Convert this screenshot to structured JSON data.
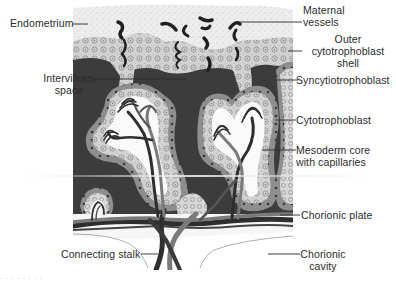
{
  "diagram": {
    "colors": {
      "background": "#ffffff",
      "endometrium": "#e9e9e9",
      "cytotrophoblast_shell": "#cfcfcf",
      "syncytiotrophoblast": "#8a8a8a",
      "intervillous_space": "#3a3a3a",
      "mesoderm_core": "#fafafa",
      "vessel_dark": "#2e2e2e",
      "vessel_light": "#7a7a7a",
      "label_text": "#2b2b2b"
    },
    "labels": {
      "endometrium": "Endometrium",
      "maternal_vessels": [
        "Maternal",
        "vessels"
      ],
      "outer_shell": [
        "Outer",
        "cytotrophoblast",
        "shell"
      ],
      "intervillous_space": [
        "Intervillous",
        "space"
      ],
      "syncytiotrophoblast": "Syncytiotrophoblast",
      "cytotrophoblast": "Cytotrophoblast",
      "mesoderm_core": [
        "Mesoderm core",
        "with capillaries"
      ],
      "chorionic_plate": "Chorionic plate",
      "connecting_stalk": "Connecting stalk",
      "chorionic_cavity": [
        "Chorionic",
        "cavity"
      ]
    },
    "footnote": "· · · · · · · ·"
  }
}
